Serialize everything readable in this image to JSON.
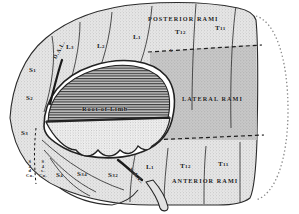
{
  "figure": {
    "name": "dermatome-nerve-ramus-distribution-diagram",
    "type": "anatomical-line-drawing",
    "root_label": "Root of Limb"
  },
  "colors": {
    "ink": "#1a1a1a",
    "paper": "#ffffff",
    "light_stipple": "#dcdcdc",
    "mid_gray": "#bdbdbd",
    "dark_gray": "#9a9a9a",
    "hatch": "#4a4a4a",
    "outline": "#2b2b2b"
  },
  "rami_bands": [
    {
      "id": "posterior",
      "label": "Posterior Rami",
      "x": 148,
      "y": 16
    },
    {
      "id": "lateral",
      "label": "Lateral Rami",
      "x": 182,
      "y": 96
    },
    {
      "id": "anterior",
      "label": "Anterior Rami",
      "x": 172,
      "y": 178
    }
  ],
  "segments_posterior": [
    {
      "label": "L",
      "sub": "3",
      "x": 66,
      "y": 44
    },
    {
      "label": "L",
      "sub": "2",
      "x": 97,
      "y": 43
    },
    {
      "label": "L",
      "sub": "1",
      "x": 133,
      "y": 34
    },
    {
      "label": "T",
      "sub": "12",
      "x": 175,
      "y": 29
    },
    {
      "label": "T",
      "sub": "11",
      "x": 215,
      "y": 25
    }
  ],
  "segments_anterior": [
    {
      "label": "L",
      "sub": "1",
      "x": 146,
      "y": 164
    },
    {
      "label": "T",
      "sub": "12",
      "x": 180,
      "y": 163
    },
    {
      "label": "T",
      "sub": "11",
      "x": 218,
      "y": 161
    }
  ],
  "segments_sacral": [
    {
      "label": "S",
      "sub": "1",
      "x": 29,
      "y": 67
    },
    {
      "label": "S",
      "sub": "2",
      "x": 26,
      "y": 95
    },
    {
      "label": "S",
      "sub": "3",
      "x": 21,
      "y": 130
    },
    {
      "label": "S",
      "sub": "4",
      "x": 56,
      "y": 172
    },
    {
      "label": "S",
      "sub": "34",
      "x": 77,
      "y": 171
    },
    {
      "label": "S",
      "sub": "32",
      "x": 108,
      "y": 172
    }
  ],
  "tiny_column_left": {
    "lines": [
      "S",
      "4",
      "d",
      "Co."
    ],
    "x": 26,
    "y": 160
  },
  "tiny_column_right": {
    "lines": [
      "S",
      "4",
      "s.",
      "Co."
    ],
    "x": 39,
    "y": 160
  },
  "diagonals": [
    {
      "id": "dorsal-axial-line",
      "text": "D.A.L.",
      "x": 55,
      "y": 56,
      "rotate": -62
    },
    {
      "id": "ventral-axial-line",
      "text": "V.A.L.",
      "x": 130,
      "y": 166,
      "rotate": 50
    }
  ],
  "markers": [
    {
      "id": "marker-b",
      "text": "b",
      "x": 170,
      "y": 49
    }
  ]
}
